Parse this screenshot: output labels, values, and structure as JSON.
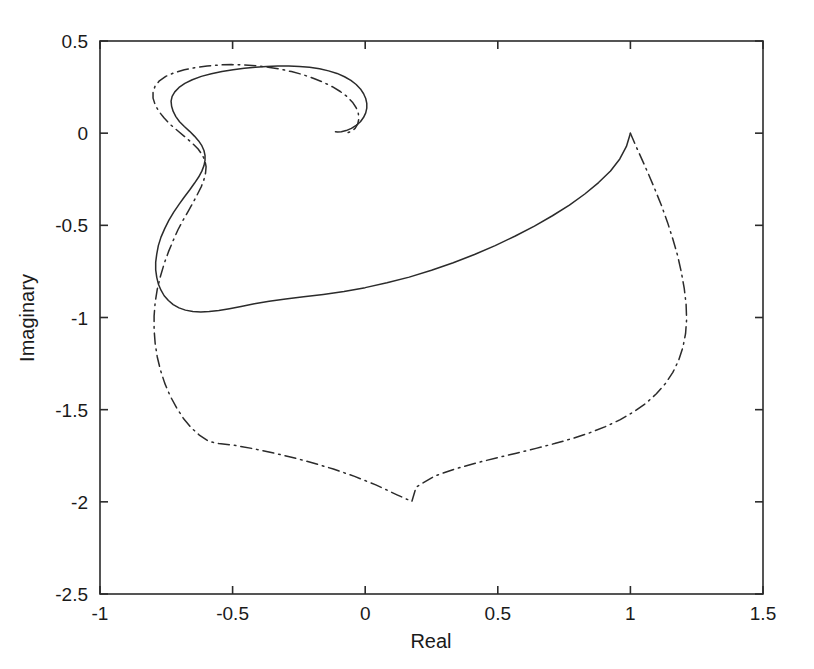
{
  "figure": {
    "background_color": "#ffffff",
    "width": 814,
    "height": 669
  },
  "axes": {
    "frame_color": "#2b2b2b",
    "text_color": "#1a1a1a",
    "x_title": "Real",
    "y_title": "Imaginary",
    "x_ticks": [
      "-1",
      "-0.5",
      "0",
      "0.5",
      "1",
      "1.5"
    ],
    "x_tick_values": [
      -1,
      -0.5,
      0,
      0.5,
      1,
      1.5
    ],
    "y_ticks": [
      "0.5",
      "0",
      "-0.5",
      "-1",
      "-1.5",
      "-2",
      "-2.5"
    ],
    "y_tick_values": [
      0.5,
      0,
      -0.5,
      -1,
      -1.5,
      -2,
      -2.5
    ],
    "xlim": [
      -1,
      1.5
    ],
    "ylim": [
      -2.5,
      0.5
    ],
    "grid": false
  },
  "chart_data": {
    "type": "line",
    "title": "",
    "subtitle": "",
    "xlabel": "Real",
    "ylabel": "Imaginary",
    "xlim": [
      -1,
      1.5
    ],
    "ylim": [
      -2.5,
      0.5
    ],
    "grid": false,
    "legend": null,
    "legend_position": "none",
    "annotations": [],
    "series": [
      {
        "name": "solid-trajectory",
        "style": "solid",
        "color": "#2b2b2b",
        "width": 1.5,
        "points": [
          [
            1.0,
            0.0
          ],
          [
            0.985,
            -0.072
          ],
          [
            0.96,
            -0.14
          ],
          [
            0.925,
            -0.205
          ],
          [
            0.88,
            -0.268
          ],
          [
            0.828,
            -0.33
          ],
          [
            0.77,
            -0.39
          ],
          [
            0.706,
            -0.448
          ],
          [
            0.638,
            -0.504
          ],
          [
            0.566,
            -0.558
          ],
          [
            0.49,
            -0.61
          ],
          [
            0.412,
            -0.658
          ],
          [
            0.332,
            -0.703
          ],
          [
            0.25,
            -0.744
          ],
          [
            0.166,
            -0.781
          ],
          [
            0.082,
            -0.812
          ],
          [
            0.0,
            -0.838
          ],
          [
            -0.08,
            -0.859
          ],
          [
            -0.158,
            -0.875
          ],
          [
            -0.232,
            -0.888
          ],
          [
            -0.3,
            -0.9
          ],
          [
            -0.362,
            -0.912
          ],
          [
            -0.418,
            -0.926
          ],
          [
            -0.468,
            -0.94
          ],
          [
            -0.512,
            -0.952
          ],
          [
            -0.552,
            -0.962
          ],
          [
            -0.588,
            -0.968
          ],
          [
            -0.62,
            -0.97
          ],
          [
            -0.65,
            -0.968
          ],
          [
            -0.678,
            -0.96
          ],
          [
            -0.702,
            -0.948
          ],
          [
            -0.724,
            -0.93
          ],
          [
            -0.742,
            -0.908
          ],
          [
            -0.758,
            -0.882
          ],
          [
            -0.77,
            -0.852
          ],
          [
            -0.78,
            -0.818
          ],
          [
            -0.786,
            -0.782
          ],
          [
            -0.79,
            -0.742
          ],
          [
            -0.79,
            -0.7
          ],
          [
            -0.786,
            -0.656
          ],
          [
            -0.78,
            -0.61
          ],
          [
            -0.77,
            -0.564
          ],
          [
            -0.756,
            -0.518
          ],
          [
            -0.74,
            -0.472
          ],
          [
            -0.722,
            -0.428
          ],
          [
            -0.702,
            -0.386
          ],
          [
            -0.682,
            -0.346
          ],
          [
            -0.662,
            -0.308
          ],
          [
            -0.644,
            -0.272
          ],
          [
            -0.628,
            -0.238
          ],
          [
            -0.616,
            -0.206
          ],
          [
            -0.608,
            -0.176
          ],
          [
            -0.604,
            -0.148
          ],
          [
            -0.604,
            -0.12
          ],
          [
            -0.608,
            -0.094
          ],
          [
            -0.616,
            -0.068
          ],
          [
            -0.628,
            -0.042
          ],
          [
            -0.644,
            -0.016
          ],
          [
            -0.662,
            0.01
          ],
          [
            -0.682,
            0.036
          ],
          [
            -0.7,
            0.062
          ],
          [
            -0.714,
            0.09
          ],
          [
            -0.724,
            0.118
          ],
          [
            -0.73,
            0.146
          ],
          [
            -0.732,
            0.174
          ],
          [
            -0.728,
            0.2
          ],
          [
            -0.718,
            0.224
          ],
          [
            -0.702,
            0.248
          ],
          [
            -0.68,
            0.27
          ],
          [
            -0.652,
            0.29
          ],
          [
            -0.618,
            0.308
          ],
          [
            -0.58,
            0.322
          ],
          [
            -0.54,
            0.334
          ],
          [
            -0.498,
            0.344
          ],
          [
            -0.456,
            0.352
          ],
          [
            -0.414,
            0.358
          ],
          [
            -0.372,
            0.362
          ],
          [
            -0.33,
            0.364
          ],
          [
            -0.288,
            0.364
          ],
          [
            -0.248,
            0.362
          ],
          [
            -0.21,
            0.358
          ],
          [
            -0.172,
            0.35
          ],
          [
            -0.138,
            0.338
          ],
          [
            -0.106,
            0.324
          ],
          [
            -0.078,
            0.306
          ],
          [
            -0.054,
            0.286
          ],
          [
            -0.034,
            0.264
          ],
          [
            -0.018,
            0.24
          ],
          [
            -0.006,
            0.214
          ],
          [
            0.002,
            0.188
          ],
          [
            0.006,
            0.162
          ],
          [
            0.006,
            0.136
          ],
          [
            0.002,
            0.11
          ],
          [
            -0.006,
            0.086
          ],
          [
            -0.018,
            0.062
          ],
          [
            -0.034,
            0.042
          ],
          [
            -0.052,
            0.026
          ],
          [
            -0.072,
            0.014
          ],
          [
            -0.09,
            0.008
          ],
          [
            -0.104,
            0.006
          ],
          [
            -0.112,
            0.008
          ]
        ]
      },
      {
        "name": "dashdot-trajectory",
        "style": "dashdot",
        "color": "#2b2b2b",
        "width": 1.5,
        "points": [
          [
            1.0,
            0.0
          ],
          [
            1.022,
            -0.074
          ],
          [
            1.046,
            -0.15
          ],
          [
            1.07,
            -0.228
          ],
          [
            1.094,
            -0.31
          ],
          [
            1.118,
            -0.396
          ],
          [
            1.14,
            -0.484
          ],
          [
            1.16,
            -0.574
          ],
          [
            1.178,
            -0.664
          ],
          [
            1.192,
            -0.754
          ],
          [
            1.203,
            -0.842
          ],
          [
            1.21,
            -0.928
          ],
          [
            1.212,
            -1.01
          ],
          [
            1.208,
            -1.088
          ],
          [
            1.198,
            -1.162
          ],
          [
            1.182,
            -1.232
          ],
          [
            1.16,
            -1.298
          ],
          [
            1.132,
            -1.358
          ],
          [
            1.098,
            -1.414
          ],
          [
            1.058,
            -1.466
          ],
          [
            1.012,
            -1.512
          ],
          [
            0.962,
            -1.554
          ],
          [
            0.906,
            -1.592
          ],
          [
            0.846,
            -1.626
          ],
          [
            0.782,
            -1.656
          ],
          [
            0.714,
            -1.684
          ],
          [
            0.644,
            -1.71
          ],
          [
            0.57,
            -1.736
          ],
          [
            0.494,
            -1.762
          ],
          [
            0.416,
            -1.79
          ],
          [
            0.338,
            -1.822
          ],
          [
            0.262,
            -1.86
          ],
          [
            0.192,
            -1.92
          ],
          [
            0.176,
            -1.998
          ],
          [
            0.12,
            -1.962
          ],
          [
            0.04,
            -1.908
          ],
          [
            -0.04,
            -1.862
          ],
          [
            -0.12,
            -1.822
          ],
          [
            -0.2,
            -1.788
          ],
          [
            -0.278,
            -1.758
          ],
          [
            -0.354,
            -1.732
          ],
          [
            -0.428,
            -1.71
          ],
          [
            -0.498,
            -1.692
          ],
          [
            -0.552,
            -1.684
          ],
          [
            -0.59,
            -1.672
          ],
          [
            -0.624,
            -1.64
          ],
          [
            -0.656,
            -1.598
          ],
          [
            -0.686,
            -1.546
          ],
          [
            -0.712,
            -1.488
          ],
          [
            -0.736,
            -1.424
          ],
          [
            -0.756,
            -1.356
          ],
          [
            -0.772,
            -1.286
          ],
          [
            -0.784,
            -1.214
          ],
          [
            -0.792,
            -1.14
          ],
          [
            -0.796,
            -1.066
          ],
          [
            -0.796,
            -0.992
          ],
          [
            -0.792,
            -0.918
          ],
          [
            -0.784,
            -0.846
          ],
          [
            -0.772,
            -0.776
          ],
          [
            -0.758,
            -0.708
          ],
          [
            -0.742,
            -0.644
          ],
          [
            -0.724,
            -0.582
          ],
          [
            -0.706,
            -0.524
          ],
          [
            -0.686,
            -0.47
          ],
          [
            -0.666,
            -0.42
          ],
          [
            -0.648,
            -0.374
          ],
          [
            -0.632,
            -0.33
          ],
          [
            -0.618,
            -0.29
          ],
          [
            -0.608,
            -0.252
          ],
          [
            -0.602,
            -0.216
          ],
          [
            -0.6,
            -0.182
          ],
          [
            -0.604,
            -0.15
          ],
          [
            -0.614,
            -0.118
          ],
          [
            -0.63,
            -0.086
          ],
          [
            -0.652,
            -0.054
          ],
          [
            -0.678,
            -0.022
          ],
          [
            -0.706,
            0.012
          ],
          [
            -0.734,
            0.046
          ],
          [
            -0.758,
            0.082
          ],
          [
            -0.778,
            0.118
          ],
          [
            -0.792,
            0.154
          ],
          [
            -0.8,
            0.19
          ],
          [
            -0.8,
            0.224
          ],
          [
            -0.792,
            0.256
          ],
          [
            -0.776,
            0.284
          ],
          [
            -0.752,
            0.308
          ],
          [
            -0.72,
            0.328
          ],
          [
            -0.682,
            0.344
          ],
          [
            -0.64,
            0.356
          ],
          [
            -0.596,
            0.364
          ],
          [
            -0.55,
            0.37
          ],
          [
            -0.504,
            0.372
          ],
          [
            -0.458,
            0.37
          ],
          [
            -0.412,
            0.366
          ],
          [
            -0.366,
            0.358
          ],
          [
            -0.322,
            0.348
          ],
          [
            -0.278,
            0.334
          ],
          [
            -0.236,
            0.318
          ],
          [
            -0.196,
            0.298
          ],
          [
            -0.158,
            0.276
          ],
          [
            -0.124,
            0.252
          ],
          [
            -0.094,
            0.226
          ],
          [
            -0.068,
            0.198
          ],
          [
            -0.048,
            0.168
          ],
          [
            -0.034,
            0.138
          ],
          [
            -0.026,
            0.108
          ],
          [
            -0.024,
            0.078
          ],
          [
            -0.028,
            0.05
          ],
          [
            -0.038,
            0.026
          ],
          [
            -0.052,
            0.01
          ],
          [
            -0.068,
            0.002
          ],
          [
            -0.082,
            0.0
          ]
        ]
      }
    ]
  }
}
